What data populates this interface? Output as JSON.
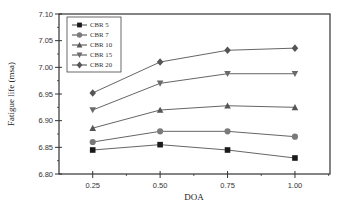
{
  "chart_data": {
    "type": "line",
    "title": "",
    "xlabel": "DOA",
    "ylabel": "Fatigue life (msa)",
    "x": [
      0.25,
      0.5,
      0.75,
      1.0
    ],
    "x_tick_labels": [
      "0.25",
      "0.50",
      "0.75",
      "1.00"
    ],
    "y_tick_labels": [
      "6.80",
      "6.85",
      "6.90",
      "6.95",
      "7.00",
      "7.05",
      "7.10"
    ],
    "xlim": [
      0.125,
      1.13
    ],
    "ylim": [
      6.8,
      7.1
    ],
    "grid": false,
    "legend_position": "upper left",
    "series": [
      {
        "name": "CBR 5",
        "marker": "square",
        "color": "#1a1a1a",
        "values": [
          6.845,
          6.855,
          6.845,
          6.83
        ]
      },
      {
        "name": "CBR 7",
        "marker": "circle",
        "color": "#7a7a7a",
        "values": [
          6.86,
          6.88,
          6.88,
          6.87
        ]
      },
      {
        "name": "CBR 10",
        "marker": "triangle-up",
        "color": "#555555",
        "values": [
          6.886,
          6.92,
          6.928,
          6.925
        ]
      },
      {
        "name": "CBR 15",
        "marker": "triangle-down",
        "color": "#6a6a6a",
        "values": [
          6.92,
          6.97,
          6.988,
          6.988
        ]
      },
      {
        "name": "CBR 20",
        "marker": "diamond",
        "color": "#555555",
        "values": [
          6.952,
          7.01,
          7.032,
          7.036
        ]
      }
    ]
  }
}
